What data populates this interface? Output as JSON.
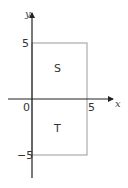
{
  "diagram": {
    "axes": {
      "x_label": "x",
      "y_label": "y",
      "origin_label": "0",
      "x_tick_label": "5",
      "y_tick_top_label": "5",
      "y_tick_bottom_label": "−5"
    },
    "regions": [
      {
        "name": "S",
        "label": "S",
        "x_range": [
          0,
          5
        ],
        "y_range": [
          0,
          5
        ]
      },
      {
        "name": "T",
        "label": "T",
        "x_range": [
          0,
          5
        ],
        "y_range": [
          -5,
          0
        ]
      }
    ],
    "colors": {
      "axis": "#222222",
      "rect": "#9a9a9a",
      "text": "#333333"
    }
  }
}
